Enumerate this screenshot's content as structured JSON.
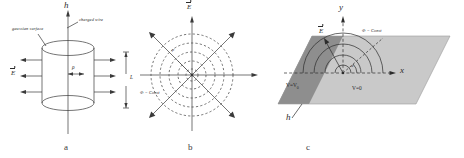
{
  "figure": {
    "background": "#ffffff",
    "ink": "#2b2b2b",
    "fill_dark": "#8e8e8e",
    "fill_light": "#c9c9c9"
  },
  "panel_a": {
    "letter": "a",
    "axis_label": "h",
    "charged_wire_label": "charged wire",
    "gaussian_surface_label": "gaussian surface",
    "field_label": "E",
    "radius_label": "ρ",
    "length_label": "L"
  },
  "panel_b": {
    "letter": "b",
    "field_label": "E",
    "equipotential_label": "Φ = Const",
    "radius_label": "ρ",
    "circle_radii": [
      6,
      14,
      23,
      32,
      41
    ],
    "ray_count": 8
  },
  "panel_c": {
    "letter": "c",
    "x_axis_label": "x",
    "y_axis_label": "y",
    "field_label": "E",
    "equipotential_label": "Φ = Const",
    "potential_high_label": "V=V",
    "potential_high_sub": "0",
    "potential_zero_label": "V=0",
    "depth_label": "h",
    "angle_label": "α",
    "arc_radii": [
      8,
      18,
      29,
      40
    ]
  }
}
